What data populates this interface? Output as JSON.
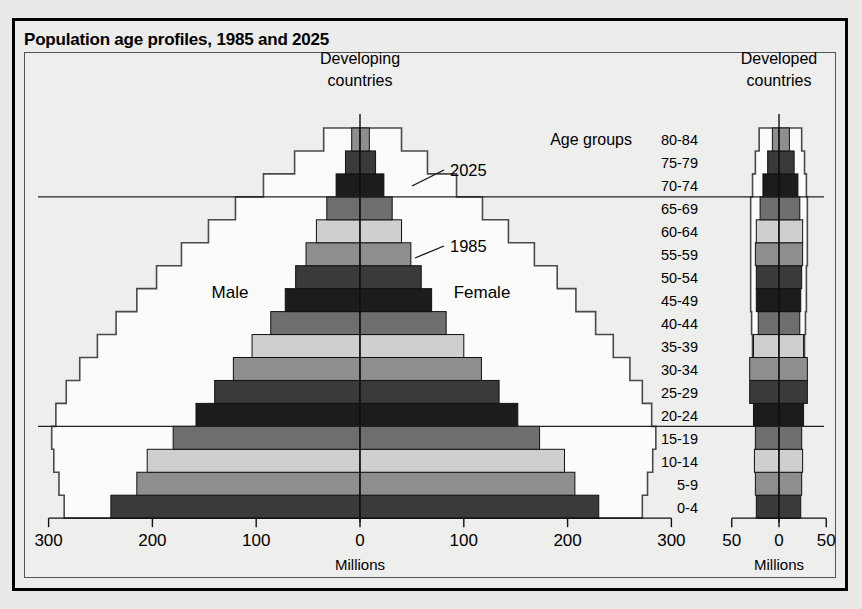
{
  "title": "Population age profiles, 1985 and 2025",
  "panels": {
    "left": {
      "heading_line1": "Developing",
      "heading_line2": "countries",
      "unit": "Millions"
    },
    "right": {
      "heading_line1": "Developed",
      "heading_line2": "countries",
      "unit": "Millions"
    }
  },
  "labels": {
    "age_groups_caption": "Age groups",
    "male": "Male",
    "female": "Female",
    "annotation_2025": "2025",
    "annotation_1985": "1985"
  },
  "chart_data": {
    "type": "bar",
    "subtype": "population-pyramid",
    "title": "Population age profiles, 1985 and 2025",
    "xlabel": "Millions",
    "ylabel": "Age groups",
    "grid": false,
    "legend_position": "inline-annotation",
    "categories": [
      "0-4",
      "5-9",
      "10-14",
      "15-19",
      "20-24",
      "25-29",
      "30-34",
      "35-39",
      "40-44",
      "45-49",
      "50-54",
      "55-59",
      "60-64",
      "65-69",
      "70-74",
      "75-79",
      "80-84"
    ],
    "left_axis_ticks": [
      300,
      200,
      100,
      0,
      100,
      200,
      300
    ],
    "right_axis_ticks": [
      50,
      0,
      50
    ],
    "left_xlim": [
      -310,
      310
    ],
    "right_xlim": [
      -55,
      55
    ],
    "reference_lines_after": [
      "15-19",
      "65-69"
    ],
    "panels": [
      {
        "name": "Developing countries",
        "unit": "Millions",
        "series": [
          {
            "name": "1985",
            "style": "filled-bars",
            "male": [
              240,
              215,
              205,
              180,
              158,
              140,
              122,
              104,
              86,
              72,
              62,
              52,
              42,
              32,
              23,
              14,
              8
            ],
            "female": [
              230,
              207,
              197,
              173,
              152,
              134,
              117,
              100,
              83,
              69,
              59,
              49,
              40,
              31,
              23,
              15,
              9
            ]
          },
          {
            "name": "2025",
            "style": "step-outline",
            "male": [
              285,
              290,
              295,
              297,
              293,
              283,
              270,
              253,
              235,
              215,
              196,
              172,
              146,
              120,
              93,
              63,
              35
            ],
            "female": [
              272,
              277,
              282,
              285,
              281,
              272,
              260,
              244,
              227,
              208,
              190,
              168,
              143,
              118,
              93,
              65,
              40
            ]
          }
        ]
      },
      {
        "name": "Developed countries",
        "unit": "Millions",
        "series": [
          {
            "name": "1985",
            "style": "filled-bars",
            "male": [
              24,
              25,
              26,
              25,
              27,
              31,
              31,
              27,
              22,
              24,
              24,
              25,
              24,
              20,
              17,
              12,
              7
            ],
            "female": [
              23,
              24,
              25,
              24,
              26,
              30,
              30,
              26,
              22,
              23,
              24,
              25,
              25,
              22,
              20,
              16,
              11
            ]
          },
          {
            "name": "2025",
            "style": "step-outline",
            "male": [
              21,
              21,
              22,
              23,
              24,
              25,
              26,
              28,
              29,
              30,
              30,
              30,
              30,
              30,
              28,
              25,
              21
            ],
            "female": [
              20,
              20,
              21,
              22,
              23,
              24,
              25,
              27,
              28,
              29,
              29,
              30,
              30,
              30,
              29,
              27,
              24
            ]
          }
        ]
      }
    ],
    "band_colors": [
      "#8e8e8e",
      "#3a3a3a",
      "#1c1c1c",
      "#6e6e6e",
      "#cfcfcf"
    ]
  }
}
